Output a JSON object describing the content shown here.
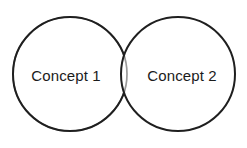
{
  "diagram": {
    "type": "venn-two-set",
    "background_color": "#ffffff",
    "stroke_color": "#1f1f1f",
    "overlap_arc_color": "#9a9a9a",
    "stroke_width": 2,
    "text_color": "#1b1b1b",
    "left_circle": {
      "label": "Concept 1",
      "cx": 70,
      "cy": 74,
      "r": 57
    },
    "right_circle": {
      "label": "Concept 2",
      "cx": 178,
      "cy": 74,
      "r": 57
    },
    "intersection": {
      "label": "",
      "fill": "none"
    }
  }
}
